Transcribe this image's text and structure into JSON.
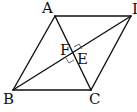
{
  "diagram": {
    "type": "geometry",
    "shape": "parallelogram",
    "points": {
      "A": {
        "label": "A",
        "x": 55,
        "y": 16
      },
      "D": {
        "label": "I",
        "x": 131,
        "y": 16
      },
      "B": {
        "label": "B",
        "x": 13,
        "y": 90
      },
      "C": {
        "label": "C",
        "x": 91,
        "y": 90
      },
      "F": {
        "label": "F"
      },
      "E": {
        "label": "E"
      }
    },
    "segments": [
      "AD",
      "DC",
      "CB",
      "BA",
      "BD",
      "AC"
    ],
    "right_angle_marks": [
      "E",
      "F"
    ],
    "colors": {
      "stroke": "#111111",
      "background": "#ffffff"
    }
  }
}
